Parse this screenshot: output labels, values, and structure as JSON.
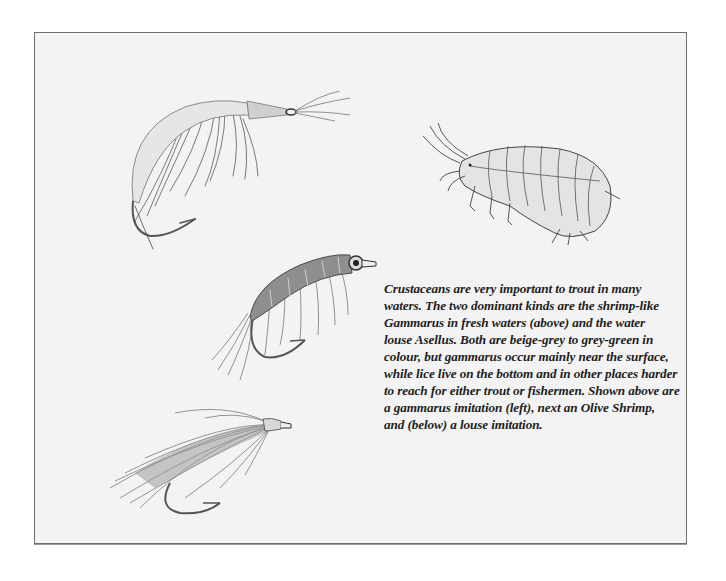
{
  "page": {
    "illustrations": [
      {
        "id": "gammarus-imitation-fly",
        "label": "gammarus imitation"
      },
      {
        "id": "gammarus-drawing",
        "label": "Gammarus"
      },
      {
        "id": "olive-shrimp-fly",
        "label": "Olive Shrimp"
      },
      {
        "id": "louse-imitation-fly",
        "label": "louse imitation"
      }
    ],
    "caption_lines": [
      "Crustaceans are very important to trout in many",
      "waters. The two dominant kinds are the shrimp-like",
      "Gammarus  in fresh waters  (above)  and the water",
      "louse  Asellus. Both are beige-grey to grey-green in",
      "colour, but gammarus occur mainly near the surface,",
      "while lice live on the bottom and in other places harder",
      "to reach for either trout or fishermen. Shown above are",
      "a gammarus imitation  (left), next an Olive Shrimp,",
      "and  (below)  a louse imitation."
    ]
  }
}
